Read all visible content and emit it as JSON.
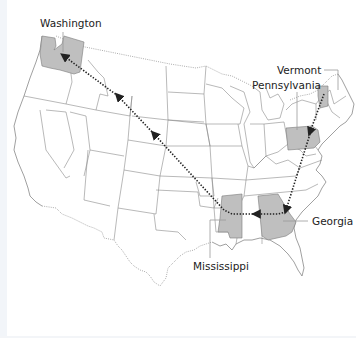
{
  "map": {
    "type": "us-states-route",
    "colors": {
      "highlight_fill": "#bfbfbf",
      "state_stroke": "#8a8a8a",
      "route_color": "#222222",
      "background": "#ffffff"
    },
    "highlighted_states": [
      "Washington",
      "Vermont",
      "Pennsylvania",
      "Georgia",
      "Mississippi"
    ],
    "labels": {
      "washington": "Washington",
      "vermont": "Vermont",
      "pennsylvania": "Pennsylvania",
      "georgia": "Georgia",
      "mississippi": "Mississippi"
    },
    "route": {
      "order": [
        "Vermont",
        "Pennsylvania",
        "Georgia",
        "Mississippi",
        "Washington"
      ],
      "style": "dotted-arrows"
    }
  }
}
